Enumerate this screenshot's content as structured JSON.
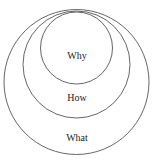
{
  "diagram": {
    "type": "nested-circles",
    "colors": {
      "stroke": "#555555",
      "text": "#222222",
      "background": "#ffffff"
    },
    "circles": [
      {
        "label": "What",
        "cx": 76.5,
        "cy": 82,
        "r": 72.5,
        "label_x": 77,
        "label_y": 141
      },
      {
        "label": "How",
        "cx": 76.5,
        "cy": 64.5,
        "r": 53.5,
        "label_x": 77,
        "label_y": 101
      },
      {
        "label": "Why",
        "cx": 76.5,
        "cy": 48,
        "r": 36,
        "label_x": 77,
        "label_y": 59
      }
    ]
  }
}
